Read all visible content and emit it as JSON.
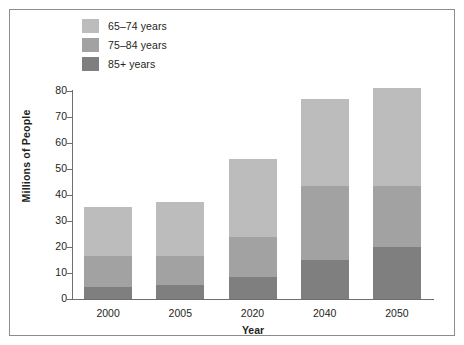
{
  "chart_data": {
    "type": "bar",
    "subtype": "stacked-vertical",
    "title": "",
    "xlabel": "Year",
    "ylabel": "Millions of People",
    "categories": [
      "2000",
      "2005",
      "2020",
      "2040",
      "2050"
    ],
    "ylim": [
      0,
      80
    ],
    "yticks": [
      0,
      10,
      20,
      30,
      40,
      50,
      60,
      70,
      80
    ],
    "grid": false,
    "legend_position": "top-left",
    "series": [
      {
        "name": "85+ years",
        "color": "#7f7f7f",
        "values": [
          4.5,
          5.5,
          8.5,
          15,
          20
        ]
      },
      {
        "name": "75–84 years",
        "color": "#a2a2a2",
        "values": [
          12,
          11,
          15.5,
          28.5,
          23.5
        ]
      },
      {
        "name": "65–74 years",
        "color": "#bcbcbc",
        "values": [
          19,
          21,
          30,
          33.5,
          37.5
        ]
      }
    ],
    "totals": [
      35.5,
      37.5,
      54,
      77,
      81
    ]
  },
  "legend": {
    "items": [
      {
        "label": "65–74 years",
        "color": "#bcbcbc"
      },
      {
        "label": "75–84 years",
        "color": "#a2a2a2"
      },
      {
        "label": "85+ years",
        "color": "#7f7f7f"
      }
    ]
  },
  "axes": {
    "y_title": "Millions of People",
    "x_title": "Year",
    "y_tick_labels": [
      "80",
      "70",
      "60",
      "50",
      "40",
      "30",
      "20",
      "10",
      "0"
    ],
    "x_tick_labels": [
      "2000",
      "2005",
      "2020",
      "2040",
      "2050"
    ]
  },
  "colors": {
    "frame": "#8c8c8c",
    "axis": "#6e6e6e",
    "text": "#231f20",
    "background": "#ffffff"
  }
}
